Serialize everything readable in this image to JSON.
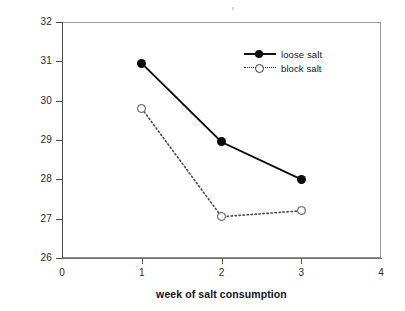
{
  "chart_data": {
    "type": "line",
    "title": "",
    "xlabel": "week of salt consumption",
    "ylabel": "water intake (liters/day)",
    "x": [
      1,
      2,
      3
    ],
    "xlim": [
      0,
      4
    ],
    "ylim": [
      26,
      32
    ],
    "xticks": [
      "0",
      "1",
      "2",
      "3",
      "4"
    ],
    "yticks": [
      "26",
      "27",
      "28",
      "29",
      "30",
      "31",
      "32"
    ],
    "grid": false,
    "legend_position": "top-right-inside",
    "series": [
      {
        "name": "loose salt",
        "values": [
          30.95,
          28.95,
          28.0
        ],
        "marker": "filled-circle",
        "linestyle": "solid",
        "color": "#0a0a0a"
      },
      {
        "name": "block salt",
        "values": [
          29.8,
          27.05,
          27.2
        ],
        "marker": "open-circle",
        "linestyle": "dotted",
        "color": "#4a4a4a"
      }
    ]
  },
  "axes": {
    "y_tick_labels": [
      "32",
      "31",
      "30",
      "29",
      "28",
      "27",
      "26"
    ],
    "x_tick_labels": [
      "0",
      "1",
      "2",
      "3",
      "4"
    ],
    "y_title": "water intake (liters/day)",
    "x_title": "week of salt consumption"
  },
  "legend": {
    "entries": [
      {
        "label": "loose salt",
        "marker": "filled-circle-icon",
        "line": "solid-line-icon"
      },
      {
        "label": "block salt",
        "marker": "open-circle-icon",
        "line": "dotted-line-icon"
      }
    ]
  }
}
